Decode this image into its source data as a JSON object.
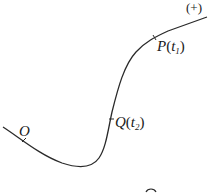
{
  "diagram": {
    "type": "parametric-curve",
    "stroke_color": "#2a2a2a",
    "orientation_label": "(+)",
    "points": [
      {
        "id": "O",
        "label": "O",
        "name": "",
        "sub": ""
      },
      {
        "id": "Q",
        "label": "Q",
        "name": "t",
        "sub": "2"
      },
      {
        "id": "P",
        "label": "P",
        "name": "t",
        "sub": "1"
      }
    ]
  }
}
